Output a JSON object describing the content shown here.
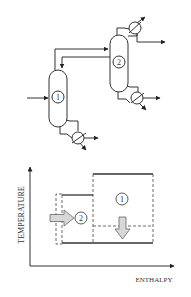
{
  "flowsheet": {
    "columns": [
      {
        "id": "column-1",
        "label": "1"
      },
      {
        "id": "column-2",
        "label": "2"
      }
    ]
  },
  "chart": {
    "y_axis_label": "TEMPERATURE",
    "x_axis_label": "ENTHALPY",
    "regions": [
      {
        "id": "region-1",
        "label": "1"
      },
      {
        "id": "region-2",
        "label": "2"
      }
    ]
  },
  "colors": {
    "line": "#333333",
    "arrow_fill": "#d8d8d8",
    "background": "#ffffff"
  }
}
